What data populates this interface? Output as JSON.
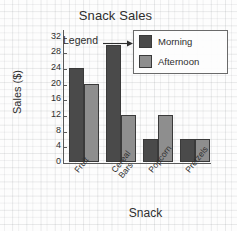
{
  "chart_data": {
    "type": "bar",
    "title": "Snack Sales",
    "xlabel": "Snack",
    "ylabel": "Sales ($)",
    "categories": [
      "Fruit",
      "Cereal Bars",
      "Popcorn",
      "Pretzels"
    ],
    "category_lines": [
      [
        "Fruit"
      ],
      [
        "Cereal",
        "Bars"
      ],
      [
        "Popcorn"
      ],
      [
        "Pretzels"
      ]
    ],
    "series": [
      {
        "name": "Morning",
        "values": [
          24,
          30,
          6,
          6
        ],
        "color": "#4a4a4a"
      },
      {
        "name": "Afternoon",
        "values": [
          20,
          12,
          12,
          6
        ],
        "color": "#8e8e8e"
      }
    ],
    "ylim": [
      0,
      34
    ],
    "yticks": [
      0,
      4,
      8,
      12,
      16,
      20,
      24,
      28,
      32
    ],
    "ytick_labels": [
      "0",
      "4",
      "8",
      "12",
      "16",
      "20",
      "24",
      "28",
      "32"
    ],
    "grid": false,
    "legend_position": "top-right"
  },
  "annotations": {
    "legend_callout": "Legend",
    "arrow_icon": "right-arrow-icon"
  },
  "legend": {
    "entries": [
      {
        "label": "Morning",
        "color": "#4a4a4a"
      },
      {
        "label": "Afternoon",
        "color": "#8e8e8e"
      }
    ]
  }
}
